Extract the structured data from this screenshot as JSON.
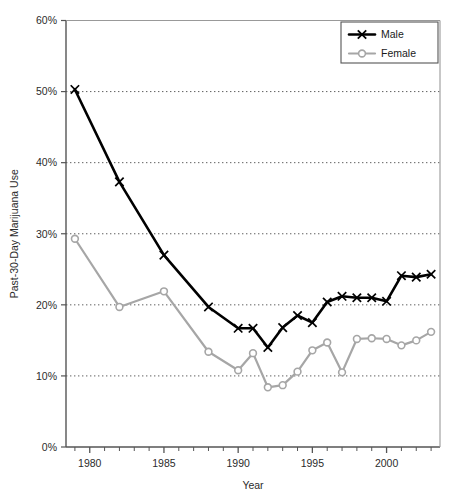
{
  "figure": {
    "cropped_title_fragment": "",
    "background": "#ffffff"
  },
  "chart_data": {
    "type": "line",
    "title": "",
    "xlabel": "Year",
    "ylabel": "Past-30-Day Marijuana Use",
    "xlim": [
      1978.4,
      2003.6
    ],
    "ylim": [
      0,
      60
    ],
    "grid": "horizontal-dotted",
    "legend_position": "top-right",
    "x_tick_labels": [
      "1980",
      "1985",
      "1990",
      "1995",
      "2000"
    ],
    "x_tick_values": [
      1980,
      1985,
      1990,
      1995,
      2000
    ],
    "x_minor_tick_step": 1,
    "y_tick_labels": [
      "0%",
      "10%",
      "20%",
      "30%",
      "40%",
      "50%",
      "60%"
    ],
    "y_tick_values": [
      0,
      10,
      20,
      30,
      40,
      50,
      60
    ],
    "series": [
      {
        "name": "Male",
        "color": "#000000",
        "marker": "x",
        "x": [
          1979,
          1982,
          1985,
          1988,
          1990,
          1991,
          1992,
          1993,
          1994,
          1995,
          1996,
          1997,
          1998,
          1999,
          2000,
          2001,
          2002,
          2003
        ],
        "values": [
          50.3,
          37.3,
          27.0,
          19.7,
          16.7,
          16.7,
          14.0,
          16.8,
          18.5,
          17.5,
          20.4,
          21.2,
          21.0,
          21.0,
          20.5,
          24.1,
          23.9,
          24.3
        ]
      },
      {
        "name": "Female",
        "color": "#a6a6a6",
        "marker": "o",
        "x": [
          1979,
          1982,
          1985,
          1988,
          1990,
          1991,
          1992,
          1993,
          1994,
          1995,
          1996,
          1997,
          1998,
          1999,
          2000,
          2001,
          2002,
          2003
        ],
        "values": [
          29.3,
          19.7,
          21.9,
          13.4,
          10.8,
          13.2,
          8.4,
          8.7,
          10.6,
          13.6,
          14.7,
          10.5,
          15.2,
          15.3,
          15.2,
          14.3,
          15.0,
          16.2
        ]
      }
    ]
  },
  "legend": {
    "items": [
      {
        "label": "Male",
        "color": "#000000",
        "marker": "x"
      },
      {
        "label": "Female",
        "color": "#a6a6a6",
        "marker": "o"
      }
    ]
  }
}
